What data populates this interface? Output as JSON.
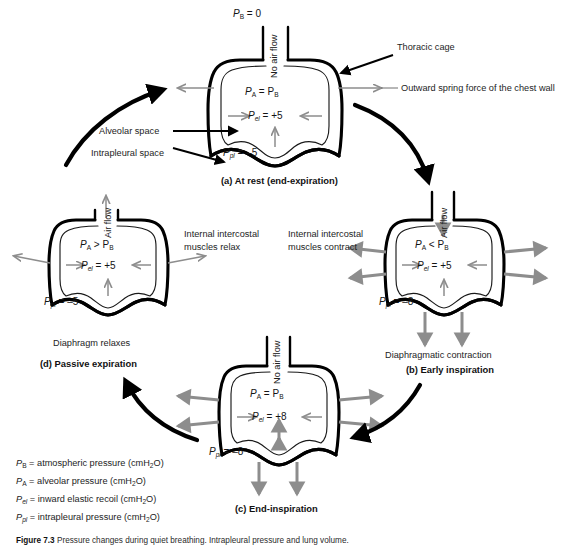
{
  "figure": {
    "title_prefix": "Figure 7.3",
    "caption": "Pressure changes during quiet breathing. Intrapleural pressure and lung volume during the respiratory cycle.",
    "background_color": "#ffffff",
    "black_color": "#000000",
    "gray_arrow_color": "#8d8d8d"
  },
  "panels": [
    {
      "id": "a",
      "caption": "(a) At rest (end-expiration)",
      "airflow_label": "No air flow",
      "pa_relation": "Pₐ = P_B",
      "pa_symbol": "P",
      "pa_sub": "A",
      "pa_operator": "=",
      "pb_symbol": "P",
      "pb_sub": "B",
      "pel_symbol": "P",
      "pel_sub": "el",
      "pel_value": "= +5",
      "ppl_symbol": "P",
      "ppl_sub": "pl",
      "ppl_value": "= –5",
      "side_note": "",
      "bottom_note": ""
    },
    {
      "id": "b",
      "caption": "(b) Early inspiration",
      "airflow_label": "Air flow",
      "pa_symbol": "P",
      "pa_sub": "A",
      "pa_operator": "<",
      "pb_symbol": "P",
      "pb_sub": "B",
      "pel_symbol": "P",
      "pel_sub": "el",
      "pel_value": "= +5",
      "ppl_symbol": "P",
      "ppl_sub": "pl",
      "ppl_value": "= –8",
      "side_note_line1": "Internal intercostal",
      "side_note_line2": "muscles contract",
      "bottom_note": "Diaphragmatic contraction"
    },
    {
      "id": "c",
      "caption": "(c) End-inspiration",
      "airflow_label": "No air flow",
      "pa_symbol": "P",
      "pa_sub": "A",
      "pa_operator": "=",
      "pb_symbol": "P",
      "pb_sub": "B",
      "pel_symbol": "P",
      "pel_sub": "el",
      "pel_value": "= +8",
      "ppl_symbol": "P",
      "ppl_sub": "pl",
      "ppl_value": "= –8",
      "side_note_line1": "",
      "side_note_line2": "",
      "bottom_note": ""
    },
    {
      "id": "d",
      "caption": "(d) Passive expiration",
      "airflow_label": "Air flow",
      "pa_symbol": "P",
      "pa_sub": "A",
      "pa_operator": ">",
      "pb_symbol": "P",
      "pb_sub": "B",
      "pel_symbol": "P",
      "pel_sub": "el",
      "pel_value": "= +5",
      "ppl_symbol": "P",
      "ppl_sub": "pl",
      "ppl_value": "= –5",
      "side_note_line1": "Internal intercostal",
      "side_note_line2": "muscles relax",
      "bottom_note": "Diaphragm relaxes"
    }
  ],
  "annotations": {
    "pb_top": {
      "symbol": "P",
      "sub": "B",
      "value": "= 0"
    },
    "thoracic_cage": "Thoracic cage",
    "outward_spring": "Outward spring force of the chest wall",
    "alveolar_space": "Alveolar space",
    "intrapleural_space": "Intrapleural space"
  },
  "legend": [
    {
      "symbol": "P",
      "sub": "B",
      "text": "= atmospheric pressure (cmH₂O)"
    },
    {
      "symbol": "P",
      "sub": "A",
      "text": "= alveolar pressure (cmH₂O)"
    },
    {
      "symbol": "P",
      "sub": "el",
      "text": "= inward elastic recoil (cmH₂O)"
    },
    {
      "symbol": "P",
      "sub": "pl",
      "text": "= intrapleural pressure (cmH₂O)"
    }
  ]
}
